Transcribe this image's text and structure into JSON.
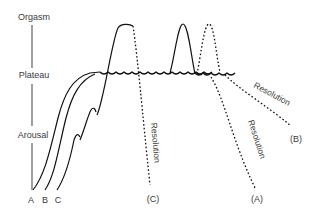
{
  "figure": {
    "axis": {
      "stages": [
        "Orgasm",
        "Plateau",
        "Arousal"
      ],
      "line_color": "#888888"
    },
    "curves": {
      "start_labels": [
        "A",
        "B",
        "C"
      ],
      "end_labels": [
        "(C)",
        "(A)",
        "(B)"
      ],
      "resolution_label": "Resolution"
    }
  }
}
